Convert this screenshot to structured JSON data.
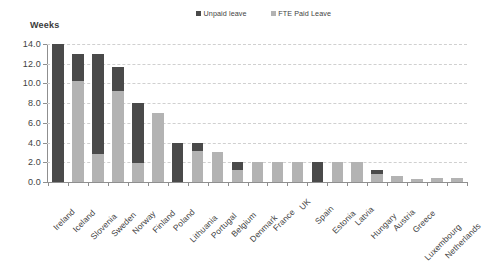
{
  "chart_data": {
    "type": "bar",
    "title": "",
    "subtitle": "",
    "ylabel": "Weeks",
    "xlabel": "",
    "ylim": [
      0.0,
      14.0
    ],
    "ytick_labels": [
      "14.0",
      "12.0",
      "10.0",
      "8.0",
      "6.0",
      "4.0",
      "2.0",
      "0.0"
    ],
    "ytick_values": [
      14.0,
      12.0,
      10.0,
      8.0,
      6.0,
      4.0,
      2.0,
      0.0
    ],
    "grid": true,
    "stacked": true,
    "legend_position": "top-center",
    "categories": [
      "Ireland",
      "Iceland",
      "Slovenia",
      "Sweden",
      "Norway",
      "Finland",
      "Poland",
      "Lithuania",
      "Portugal",
      "Belgium",
      "Denmark",
      "France",
      "UK",
      "Spain",
      "Estonia",
      "Latvia",
      "Hungary",
      "Austria",
      "Greece",
      "Luxembourg",
      "Netherlands"
    ],
    "series": [
      {
        "name": "FTE Paid Leave",
        "color": "#b3b3b3",
        "values": [
          0.0,
          10.2,
          2.8,
          9.2,
          1.9,
          7.0,
          0.0,
          3.1,
          3.0,
          1.2,
          2.0,
          2.0,
          2.0,
          0.0,
          2.0,
          2.0,
          0.8,
          0.6,
          0.3,
          0.4,
          0.4
        ]
      },
      {
        "name": "Unpaid leave",
        "color": "#4a4a4a",
        "values": [
          14.0,
          2.8,
          10.2,
          2.5,
          6.1,
          0.0,
          4.0,
          0.9,
          0.0,
          0.8,
          0.0,
          0.0,
          0.0,
          2.0,
          0.0,
          0.0,
          0.4,
          0.0,
          0.0,
          0.0,
          0.0
        ]
      }
    ],
    "totals": [
      14.0,
      13.0,
      13.0,
      11.7,
      8.0,
      7.0,
      4.0,
      4.0,
      3.0,
      2.0,
      2.0,
      2.0,
      2.0,
      2.0,
      2.0,
      2.0,
      1.2,
      0.6,
      0.3,
      0.4,
      0.4
    ]
  },
  "legend": {
    "entries": [
      {
        "label": "Unpaid leave",
        "color": "#4a4a4a"
      },
      {
        "label": "FTE Paid Leave",
        "color": "#b3b3b3"
      }
    ]
  },
  "colors": {
    "unpaid": "#4a4a4a",
    "paid": "#b3b3b3",
    "axis": "#8f8f8f",
    "grid": "#d0d0d0",
    "text": "#3f3f3f",
    "background": "#ffffff"
  }
}
